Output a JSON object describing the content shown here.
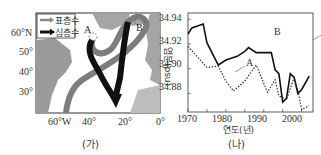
{
  "map": {
    "caption": "(가)",
    "legend": [
      {
        "label": "표층수",
        "color": "#8a8a8a"
      },
      {
        "label": "심층수",
        "color": "#111111"
      }
    ],
    "markers": [
      "A",
      "B"
    ],
    "lat_labels": [
      "60°N",
      "50°",
      "40°",
      "30°"
    ],
    "lon_labels": [
      "60°W",
      "40°",
      "20°",
      "0°"
    ]
  },
  "chart": {
    "caption": "(나)",
    "xlabel": "연도(년)",
    "ylabel": "염분(psu)",
    "y_ticks": [
      "34.94",
      "34.92",
      "34.90",
      "34.88"
    ],
    "x_ticks": [
      "1970",
      "1980",
      "1990",
      "2000"
    ],
    "series_labels": {
      "A": "A",
      "B": "B"
    }
  },
  "chart_data": {
    "type": "line",
    "title": "",
    "xlabel": "연도(년)",
    "ylabel": "염분(psu)",
    "xlim": [
      1970,
      2003
    ],
    "ylim": [
      34.865,
      34.945
    ],
    "grid": false,
    "series": [
      {
        "name": "B",
        "style": "solid",
        "x": [
          1970,
          1971,
          1974,
          1975,
          1978,
          1980,
          1983,
          1985,
          1986,
          1988,
          1992,
          1993,
          1994,
          1995,
          1996,
          1997,
          1998,
          1999,
          2000,
          2002
        ],
        "y": [
          34.928,
          34.933,
          34.936,
          34.921,
          34.903,
          34.907,
          34.91,
          34.914,
          34.917,
          34.913,
          34.913,
          34.899,
          34.896,
          34.873,
          34.876,
          34.896,
          34.893,
          34.88,
          34.883,
          34.894
        ]
      },
      {
        "name": "A",
        "style": "dotted",
        "x": [
          1970,
          1975,
          1978,
          1980,
          1982,
          1985,
          1988,
          1991,
          1993,
          1994,
          1996,
          1998,
          1999,
          2000,
          2002
        ],
        "y": [
          34.918,
          34.901,
          34.902,
          34.89,
          34.882,
          34.89,
          34.903,
          34.881,
          34.891,
          34.878,
          34.875,
          34.893,
          34.883,
          34.867,
          34.87
        ]
      }
    ]
  }
}
